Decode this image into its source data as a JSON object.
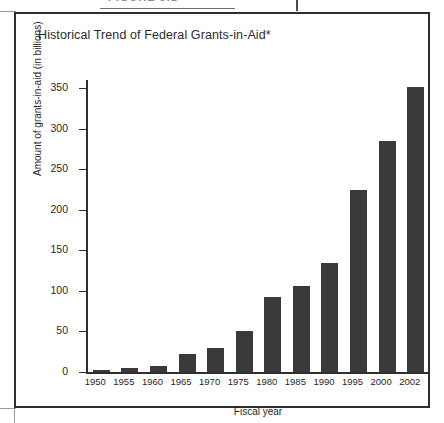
{
  "figure": {
    "header_label": "FIGURE 3.1",
    "title": "Historical Trend of Federal Grants-in-Aid*"
  },
  "chart_data": {
    "type": "bar",
    "title": "Historical Trend of Federal Grants-in-Aid*",
    "xlabel": "Fiscal year",
    "ylabel": "Amount of grants-in-aid (in billions)",
    "categories": [
      "1950",
      "1955",
      "1960",
      "1965",
      "1970",
      "1975",
      "1980",
      "1985",
      "1990",
      "1995",
      "2000",
      "2002"
    ],
    "values": [
      2,
      5,
      7,
      22,
      30,
      50,
      92,
      106,
      135,
      225,
      285,
      352
    ],
    "ylim": [
      0,
      360
    ],
    "yticks": [
      0,
      50,
      100,
      150,
      200,
      250,
      300,
      350
    ],
    "ytick_labels": [
      "0",
      "50",
      "100",
      "150",
      "200",
      "250",
      "300",
      "350"
    ],
    "grid": false,
    "legend": null,
    "bar_color": "#3a3a3a",
    "axis_color": "#2e2e2e"
  }
}
